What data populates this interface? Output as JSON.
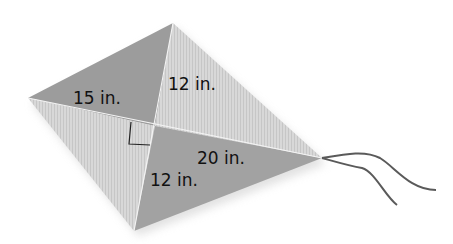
{
  "figure": {
    "shape": "kite",
    "labels": {
      "upper_left_segment": "15 in.",
      "upper_vertical_segment": "12 in.",
      "right_segment": "20 in.",
      "lower_vertical_segment": "12 in."
    },
    "right_angle_marker": true,
    "colors": {
      "dark_face": "#9a9a9a",
      "light_face": "#d4d4d4",
      "string": "#555555",
      "text": "#111111"
    }
  }
}
